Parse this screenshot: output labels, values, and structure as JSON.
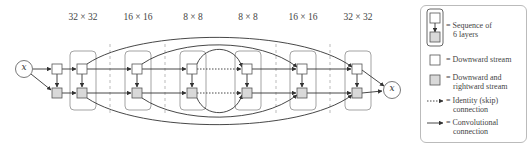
{
  "diagram": {
    "input_label": "x",
    "output_label": "x",
    "resolutions": [
      {
        "label": "32 × 32",
        "x": 84
      },
      {
        "label": "16 × 16",
        "x": 138
      },
      {
        "label": "8 × 8",
        "x": 193
      },
      {
        "label": "8 × 8",
        "x": 248
      },
      {
        "label": "16 × 16",
        "x": 303
      },
      {
        "label": "32 × 32",
        "x": 358
      }
    ],
    "colors": {
      "stroke": "#333333",
      "frame": "#999999",
      "downward_fill": "#ffffff",
      "rightward_fill": "#d9d9d9",
      "dashed_divider": "#aaaaaa"
    }
  },
  "legend": {
    "sequence": {
      "line1": "= Sequence of",
      "line2": "6 layers"
    },
    "downward": {
      "line1": "= Downward stream"
    },
    "downward_rightward": {
      "line1": "= Downward and",
      "line2": "rightward stream"
    },
    "identity": {
      "line1": "= Identity (skip)",
      "line2": "connection"
    },
    "convolutional": {
      "line1": "= Convolutional",
      "line2": "connection"
    }
  }
}
